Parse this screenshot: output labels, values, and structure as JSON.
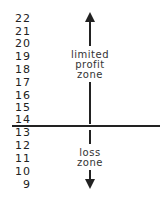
{
  "diagram": {
    "scale_labels": [
      "22",
      "21",
      "20",
      "19",
      "18",
      "17",
      "16",
      "15",
      "14",
      "13",
      "12",
      "11",
      "10",
      "9"
    ],
    "profit_label": [
      "limited",
      "profit",
      "zone"
    ],
    "loss_label": [
      "loss",
      "zone"
    ],
    "breakeven_value": "14",
    "line_color": "#222222"
  }
}
